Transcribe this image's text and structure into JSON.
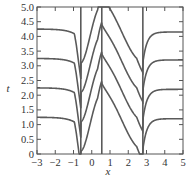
{
  "chart_data": {
    "type": "line",
    "title": "",
    "xlabel": "x",
    "ylabel": "t",
    "xlim": [
      -3,
      5
    ],
    "ylim": [
      0,
      5.0
    ],
    "xticks": [
      -3,
      -2,
      -1,
      0,
      1,
      2,
      3,
      4,
      5
    ],
    "xtick_labels": [
      "−3",
      "−2",
      "−1",
      "0",
      "1",
      "2",
      "3",
      "4",
      "5"
    ],
    "yticks": [
      0,
      0.5,
      1.0,
      1.5,
      2.0,
      2.5,
      3.0,
      3.5,
      4.0,
      4.5,
      5.0
    ],
    "ytick_labels": [
      "0",
      "0.5",
      "1.0",
      "1.5",
      "2.0",
      "2.5",
      "3.0",
      "3.5",
      "4.0",
      "4.5",
      "5.0"
    ],
    "grid": false,
    "legend": null,
    "vertical_lines": [
      {
        "x": -0.6,
        "t_from": 0,
        "t_to": 5.0
      },
      {
        "x": 0.55,
        "t_from": 0,
        "t_to": 5.0
      },
      {
        "x": 2.8,
        "t_from": 0,
        "t_to": 5.0
      }
    ],
    "series": [
      {
        "name": "curve-1",
        "baseline_t": 1.2,
        "left_asymptote_t": 1.25,
        "right_asymptote_t": 1.2
      },
      {
        "name": "curve-2",
        "baseline_t": 2.2,
        "left_asymptote_t": 2.25,
        "right_asymptote_t": 2.2
      },
      {
        "name": "curve-3",
        "baseline_t": 3.2,
        "left_asymptote_t": 3.25,
        "right_asymptote_t": 3.2
      },
      {
        "name": "curve-4",
        "baseline_t": 4.2,
        "left_asymptote_t": 4.25,
        "right_asymptote_t": 4.15
      }
    ]
  },
  "colors": {
    "curve": "#5a5a5a",
    "frame": "#555555",
    "text": "#333333",
    "background": "#ffffff"
  }
}
